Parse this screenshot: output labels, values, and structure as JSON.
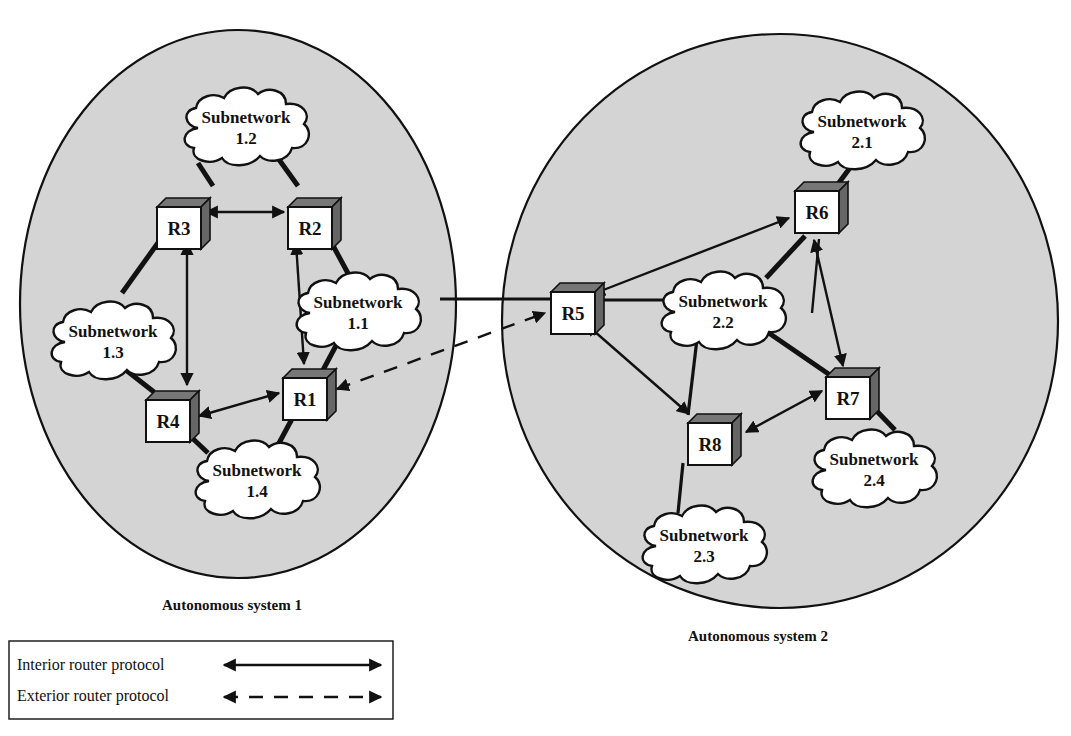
{
  "figure": {
    "autonomous_systems": [
      {
        "id": "as1",
        "label": "Autonomous system 1",
        "cx": 238,
        "cy": 304,
        "rx": 218,
        "ry": 274,
        "label_x": 232,
        "label_y": 610
      },
      {
        "id": "as2",
        "label": "Autonomous system 2",
        "cx": 780,
        "cy": 321,
        "rx": 278,
        "ry": 287,
        "label_x": 758,
        "label_y": 641
      }
    ],
    "routers": [
      {
        "id": "R1",
        "label": "R1",
        "x": 283,
        "y": 369
      },
      {
        "id": "R2",
        "label": "R2",
        "x": 288,
        "y": 198
      },
      {
        "id": "R3",
        "label": "R3",
        "x": 157,
        "y": 198
      },
      {
        "id": "R4",
        "label": "R4",
        "x": 146,
        "y": 391
      },
      {
        "id": "R5",
        "label": "R5",
        "x": 551,
        "y": 283
      },
      {
        "id": "R6",
        "label": "R6",
        "x": 795,
        "y": 182
      },
      {
        "id": "R7",
        "label": "R7",
        "x": 826,
        "y": 368
      },
      {
        "id": "R8",
        "label": "R8",
        "x": 688,
        "y": 414
      }
    ],
    "subnetworks": [
      {
        "id": "1.1",
        "line1": "Subnetwork",
        "line2": "1.1",
        "cx": 358,
        "cy": 309
      },
      {
        "id": "1.2",
        "line1": "Subnetwork",
        "line2": "1.2",
        "cx": 246,
        "cy": 124
      },
      {
        "id": "1.3",
        "line1": "Subnetwork",
        "line2": "1.3",
        "cx": 113,
        "cy": 338
      },
      {
        "id": "1.4",
        "line1": "Subnetwork",
        "line2": "1.4",
        "cx": 257,
        "cy": 477
      },
      {
        "id": "2.1",
        "line1": "Subnetwork",
        "line2": "2.1",
        "cx": 862,
        "cy": 128
      },
      {
        "id": "2.2",
        "line1": "Subnetwork",
        "line2": "2.2",
        "cx": 723,
        "cy": 308
      },
      {
        "id": "2.3",
        "line1": "Subnetwork",
        "line2": "2.3",
        "cx": 704,
        "cy": 542
      },
      {
        "id": "2.4",
        "line1": "Subnetwork",
        "line2": "2.4",
        "cx": 874,
        "cy": 466
      }
    ],
    "legend": {
      "items": [
        {
          "label": "Interior router protocol",
          "style": "solid"
        },
        {
          "label": "Exterior router protocol",
          "style": "dashed"
        }
      ]
    }
  }
}
